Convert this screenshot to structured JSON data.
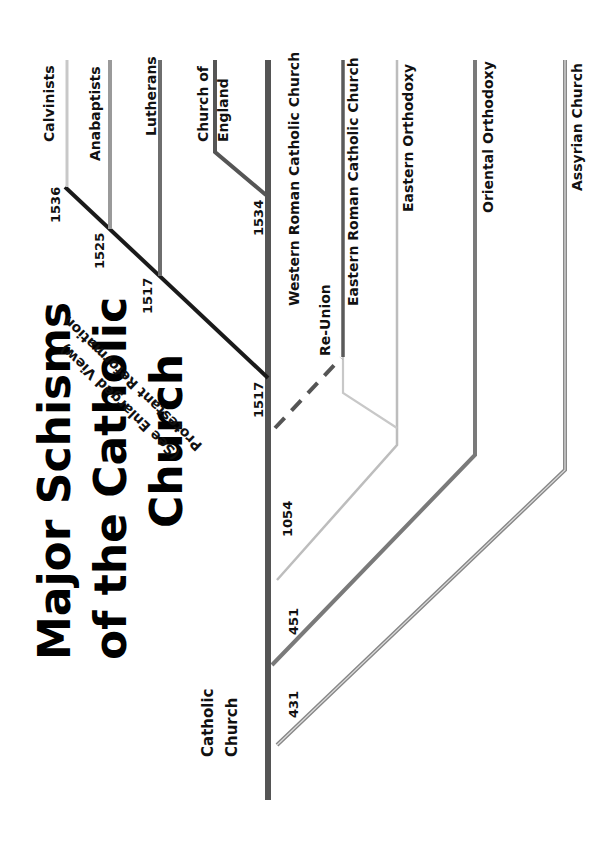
{
  "title": {
    "line1": "Major Schisms",
    "line2": "of the Catholic",
    "line3": "Church"
  },
  "root": {
    "label_line1": "Catholic",
    "label_line2": "Church"
  },
  "dates": {
    "d431": "431",
    "d451": "451",
    "d1054": "1054",
    "d1517_main": "1517",
    "d1517_branch": "1517",
    "d1525": "1525",
    "d1536": "1536",
    "d1534": "1534"
  },
  "branches": {
    "western": "Western Roman Catholic Church",
    "eastern_rc": "Eastern Roman Catholic Church",
    "eastern_orthodoxy": "Eastern Orthodoxy",
    "oriental_orthodoxy": "Oriental Orthodoxy",
    "assyrian": "Assyrian Church",
    "calvinists": "Calvinists",
    "anabaptists": "Anabaptists",
    "lutherans": "Lutherans",
    "coe_line1": "Church of",
    "coe_line2": "England"
  },
  "annotations": {
    "reunion": "Re-Union",
    "protestant_line1": "Protestant Reformation",
    "protestant_line2": "(See Enlarged View)"
  },
  "colors": {
    "trunk": "#555555",
    "protestant": "#1a1a1a",
    "light_gray": "#c8c8c8",
    "mid_gray": "#8a8a8a",
    "dark_gray": "#666666"
  }
}
